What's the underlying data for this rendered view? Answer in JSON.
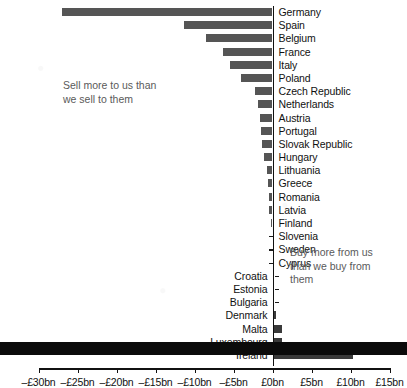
{
  "chart_data": {
    "type": "bar",
    "orientation": "horizontal",
    "title": "",
    "xlabel": "",
    "ylabel": "",
    "xlim": [
      -32,
      16
    ],
    "grid": false,
    "legend": "none",
    "units": "£bn",
    "categories": [
      "Germany",
      "Spain",
      "Belgium",
      "France",
      "Italy",
      "Poland",
      "Czech Republic",
      "Netherlands",
      "Austria",
      "Portugal",
      "Slovak Republic",
      "Hungary",
      "Lithuania",
      "Greece",
      "Romania",
      "Latvia",
      "Finland",
      "Slovenia",
      "Sweden",
      "Cyprus",
      "Croatia",
      "Estonia",
      "Bulgaria",
      "Denmark",
      "Malta",
      "Luxembourg",
      "Ireland"
    ],
    "values": [
      -27.0,
      -11.4,
      -8.5,
      -6.4,
      -5.5,
      -4.0,
      -2.3,
      -1.8,
      -1.6,
      -1.5,
      -1.4,
      -1.1,
      -0.7,
      -0.6,
      -0.5,
      -0.4,
      -0.2,
      -0.15,
      -0.1,
      -0.05,
      0.05,
      0.1,
      0.15,
      0.3,
      1.0,
      1.1,
      10.1
    ],
    "xticks": [
      -30,
      -25,
      -20,
      -15,
      -10,
      -5,
      0,
      5,
      10,
      15
    ],
    "xtick_labels": [
      "–£30bn",
      "–£25bn",
      "–£20bn",
      "–£15bn",
      "–£10bn",
      "–£5bn",
      "£0bn",
      "£5bn",
      "£10bn",
      "£15bn"
    ],
    "annotations": [
      {
        "name": "sell-more-note",
        "text": "Sell more to us than\nwe sell to them"
      },
      {
        "name": "buy-more-note",
        "text": "Buy more from us\nthan we buy from\nthem"
      }
    ]
  },
  "colors": {
    "bar": "#555555",
    "bar_positive": "#3a3a3a",
    "axis": "#111111",
    "annotation_text": "#5a5a5a",
    "label_text": "#111111",
    "background": "#ffffff",
    "bottom_band": "#0b0b0b"
  }
}
